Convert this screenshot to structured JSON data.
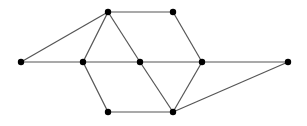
{
  "diagram": {
    "type": "graph",
    "width": 307,
    "height": 126,
    "colors": {
      "edge": "#555555",
      "node": "#000000",
      "background": "#ffffff"
    },
    "node_radius": 3.2,
    "nodes": [
      {
        "id": "A",
        "x": 21,
        "y": 62
      },
      {
        "id": "B",
        "x": 108,
        "y": 12
      },
      {
        "id": "C",
        "x": 173,
        "y": 12
      },
      {
        "id": "D",
        "x": 83,
        "y": 62
      },
      {
        "id": "E",
        "x": 140,
        "y": 62
      },
      {
        "id": "F",
        "x": 202,
        "y": 62
      },
      {
        "id": "G",
        "x": 288,
        "y": 62
      },
      {
        "id": "H",
        "x": 108,
        "y": 112
      },
      {
        "id": "I",
        "x": 173,
        "y": 112
      }
    ],
    "edges": [
      [
        "A",
        "B"
      ],
      [
        "A",
        "D"
      ],
      [
        "B",
        "C"
      ],
      [
        "B",
        "D"
      ],
      [
        "B",
        "E"
      ],
      [
        "C",
        "F"
      ],
      [
        "D",
        "E"
      ],
      [
        "E",
        "F"
      ],
      [
        "F",
        "G"
      ],
      [
        "D",
        "H"
      ],
      [
        "H",
        "I"
      ],
      [
        "E",
        "I"
      ],
      [
        "F",
        "I"
      ],
      [
        "I",
        "G"
      ]
    ]
  }
}
